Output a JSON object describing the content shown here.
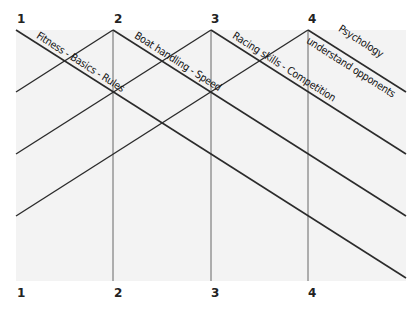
{
  "diagram": {
    "top_markers": [
      "1",
      "2",
      "3",
      "4"
    ],
    "bottom_markers": [
      "1",
      "2",
      "3",
      "4"
    ],
    "topics": [
      {
        "label": "Fitness - Basics - Rules"
      },
      {
        "label": "Boat handling - Speed"
      },
      {
        "label": "Racing skills - Competition"
      },
      {
        "label": "understand opponents"
      },
      {
        "label": "Psychology"
      }
    ],
    "colors": {
      "line": "#2b2b2b",
      "panel": "#f3f3f3",
      "divider": "#555555"
    }
  }
}
